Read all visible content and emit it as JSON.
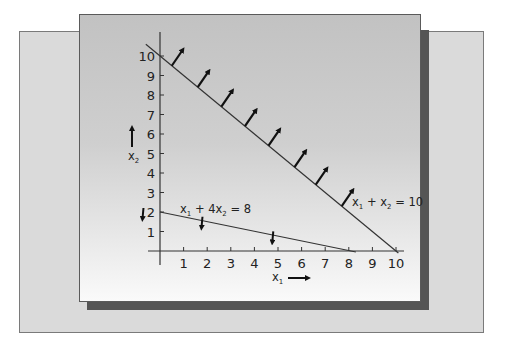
{
  "chart_data": {
    "type": "line",
    "title": "",
    "xlabel": "x1",
    "ylabel": "x2",
    "xlim": [
      0,
      10
    ],
    "ylim": [
      0,
      10
    ],
    "x_ticks": [
      "1",
      "2",
      "3",
      "4",
      "5",
      "6",
      "7",
      "8",
      "9",
      "10"
    ],
    "y_ticks": [
      "1",
      "2",
      "3",
      "4",
      "5",
      "6",
      "7",
      "8",
      "9",
      "10"
    ],
    "grid": false,
    "series": [
      {
        "name": "x1 + x2 = 10",
        "label_parts": {
          "a": "x",
          "a_sub": "1",
          "op": " + ",
          "b": "x",
          "b_sub": "2",
          "rhs": " = 10"
        },
        "points": [
          [
            0,
            10
          ],
          [
            10,
            0
          ]
        ],
        "arrow_direction": "up-right (>= region)",
        "arrow_positions_x1": [
          0.5,
          1.6,
          2.6,
          3.6,
          4.6,
          5.7,
          6.6,
          7.7
        ]
      },
      {
        "name": "x1 + 4x2 = 8",
        "label_parts": {
          "a": "x",
          "a_sub": "1",
          "op": " + 4",
          "b": "x",
          "b_sub": "2",
          "rhs": " = 8"
        },
        "points": [
          [
            0,
            2
          ],
          [
            8,
            0
          ]
        ],
        "arrow_direction": "down (<= region)",
        "arrow_positions_x1": [
          -0.7,
          1.8,
          4.8
        ]
      }
    ],
    "axis_arrows": {
      "x1": "right",
      "x2": "up"
    }
  }
}
